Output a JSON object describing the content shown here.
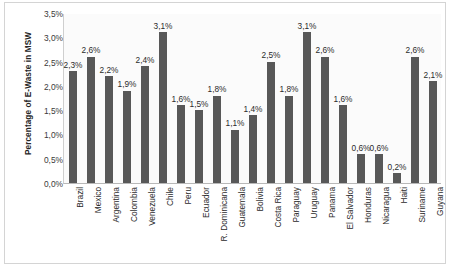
{
  "chart_data": {
    "type": "bar",
    "title": "",
    "xlabel": "",
    "ylabel": "Percentage of E-Waste  in MSW",
    "ylim": [
      0,
      3.5
    ],
    "ytick_labels": [
      "3,5%",
      "3,0%",
      "2,5%",
      "2,0%",
      "1,5%",
      "1,0%",
      "0,5%",
      "0,0%"
    ],
    "ytick_values": [
      3.5,
      3.0,
      2.5,
      2.0,
      1.5,
      1.0,
      0.5,
      0.0
    ],
    "grid": false,
    "legend": "none",
    "bar_color": "#585858",
    "categories": [
      "Brazil",
      "Mexico",
      "Argentina",
      "Colombia",
      "Venezuela",
      "Chile",
      "Peru",
      "Ecuador",
      "R. Dominicana",
      "Guatemala",
      "Bolivia",
      "Costa Rica",
      "Paraguay",
      "Uruguay",
      "Panama",
      "El Salvador",
      "Honduras",
      "Nicaragua",
      "Haiti",
      "Suriname",
      "Guyana"
    ],
    "values": [
      2.3,
      2.6,
      2.2,
      1.9,
      2.4,
      3.1,
      1.6,
      1.5,
      1.8,
      1.1,
      1.4,
      2.5,
      1.8,
      3.1,
      2.6,
      1.6,
      0.6,
      0.6,
      0.2,
      2.6,
      2.1
    ],
    "data_labels": [
      "2,3%",
      "2,6%",
      "2,2%",
      "1,9%",
      "2,4%",
      "3,1%",
      "1,6%",
      "1,5%",
      "1,8%",
      "1,1%",
      "1,4%",
      "2,5%",
      "1,8%",
      "3,1%",
      "2,6%",
      "1,6%",
      "0,6%",
      "0,6%",
      "0,2%",
      "2,6%",
      "2,1%"
    ]
  }
}
